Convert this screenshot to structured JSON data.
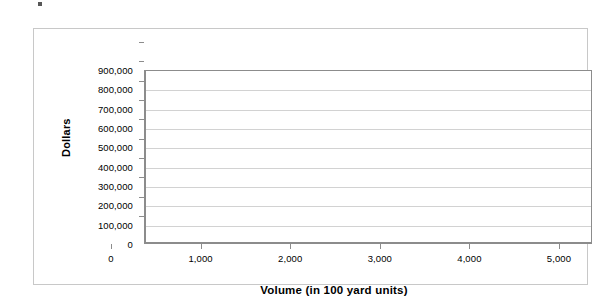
{
  "chart_data": {
    "type": "line",
    "title": "",
    "subtitle": "",
    "xlabel": "Volume (in 100 yard units)",
    "ylabel": "Dollars",
    "xlim": [
      0,
      5000
    ],
    "ylim": [
      0,
      900000
    ],
    "x_ticks": [
      0,
      1000,
      2000,
      3000,
      4000,
      5000
    ],
    "x_tick_labels": [
      "0",
      "1,000",
      "2,000",
      "3,000",
      "4,000",
      "5,000"
    ],
    "y_ticks": [
      0,
      100000,
      200000,
      300000,
      400000,
      500000,
      600000,
      700000,
      800000,
      900000
    ],
    "y_tick_labels": [
      "0",
      "100,000",
      "200,000",
      "300,000",
      "400,000",
      "500,000",
      "600,000",
      "700,000",
      "800,000",
      "900,000"
    ],
    "series": [],
    "annotations": [],
    "legend": {
      "visible": false,
      "position": "none",
      "entries": []
    },
    "grid": {
      "horizontal": true,
      "vertical": false
    },
    "note": "Plot area is empty - axes and gridlines only, no data plotted"
  },
  "colors": {
    "frame_border": "#c8c8c8",
    "axis_line": "#8c8c8c",
    "gridline": "#d2d2d2",
    "text": "#000000",
    "background": "#ffffff"
  }
}
